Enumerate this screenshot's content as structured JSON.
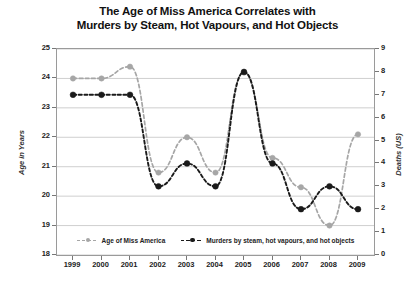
{
  "chart_data": {
    "type": "line",
    "title": "The Age of Miss America Correlates with Murders by Steam, Hot Vapours, and Hot Objects",
    "title_line1": "The Age of Miss America Correlates with",
    "title_line2": "Murders by Steam, Hot Vapours, and Hot Objects",
    "xlabel": "",
    "categories": [
      "1999",
      "2000",
      "2001",
      "2002",
      "2003",
      "2004",
      "2005",
      "2006",
      "2007",
      "2008",
      "2009"
    ],
    "grid": true,
    "legend_position": "bottom",
    "series": [
      {
        "name": "Age of Miss America",
        "axis": "left",
        "color": "#a6a6a6",
        "marker": "circle",
        "linestyle": "dashed",
        "values": [
          24.0,
          24.0,
          24.4,
          20.8,
          22.0,
          20.8,
          24.2,
          21.3,
          20.3,
          19.0,
          22.1
        ]
      },
      {
        "name": "Murders by steam, hot vapours, and hot objects",
        "axis": "right",
        "color": "#1a1a1a",
        "marker": "circle",
        "linestyle": "dashed",
        "values": [
          7,
          7,
          7,
          3,
          4,
          3,
          8,
          4,
          2,
          3,
          2
        ]
      }
    ],
    "left_axis": {
      "label": "Age in Years",
      "ylim": [
        18,
        25
      ],
      "ticks": [
        "25",
        "24",
        "23",
        "22",
        "21",
        "20",
        "19",
        "18"
      ]
    },
    "right_axis": {
      "label": "Deaths (US)",
      "ylim": [
        0,
        9
      ],
      "ticks": [
        "9",
        "8",
        "7",
        "6",
        "5",
        "4",
        "3",
        "2",
        "1",
        "0"
      ]
    }
  },
  "legend": [
    {
      "label": "Age of Miss America",
      "color": "#a6a6a6"
    },
    {
      "label": "Murders by steam, hot vapours, and hot objects",
      "color": "#1a1a1a"
    }
  ]
}
